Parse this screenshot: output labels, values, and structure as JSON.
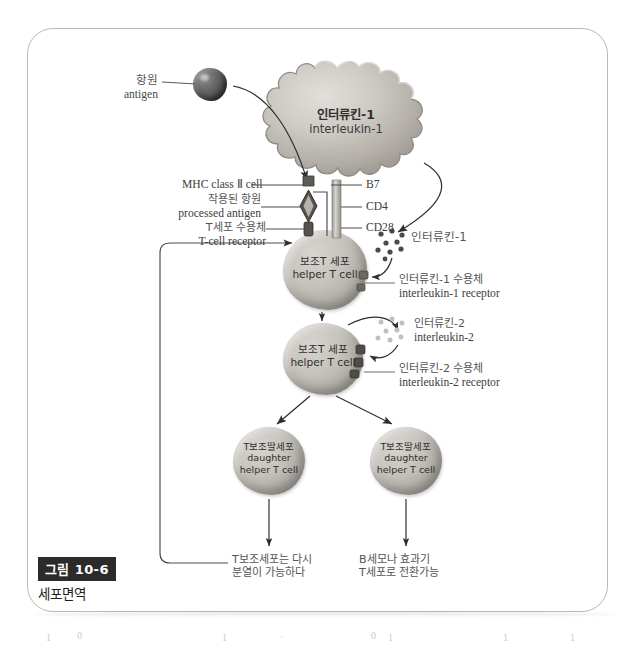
{
  "figure": {
    "number_badge": "그림 10-6",
    "title": "세포면역"
  },
  "cells": {
    "antigen": {
      "ko": "항원",
      "en": "antigen"
    },
    "macrophage": {
      "ko": "인터류킨-1",
      "en": "interleukin-1"
    },
    "helper_t_1": {
      "ko": "보조T 세포",
      "en": "helper T cell"
    },
    "helper_t_2": {
      "ko": "보조T 세포",
      "en": "helper T cell"
    },
    "daughter_left": {
      "ko": "T보조딸세포",
      "en1": "daughter",
      "en2": "helper T cell"
    },
    "daughter_right": {
      "ko": "T보조딸세포",
      "en1": "daughter",
      "en2": "helper T cell"
    }
  },
  "labels_left": {
    "mhc": "MHC class Ⅱ cell",
    "processed_antigen_ko": "작용된 항원",
    "processed_antigen_en": "processed antigen",
    "tcr_ko": "T세포 수용체",
    "tcr_en": "T-cell receptor"
  },
  "labels_right": {
    "b7": "B7",
    "cd4": "CD4",
    "cd28": "CD28",
    "il1_ko": "인터류킨-1",
    "il1_receptor_ko": "인터류킨-1 수용체",
    "il1_receptor_en": "interleukin-1 receptor",
    "il2_ko": "인터류킨-2",
    "il2_en": "interleukin-2",
    "il2_receptor_ko": "인터류킨-2 수용체",
    "il2_receptor_en": "interleukin-2 receptor"
  },
  "footnotes": {
    "left_line1": "T보조세포는 다시",
    "left_line2": "분열이 가능하다",
    "right_line1": "B세모나 효과기",
    "right_line2": "T세포로 전환가능"
  },
  "artifacts": [
    "1",
    "0",
    "1",
    "·",
    "0",
    "1",
    "1",
    "1"
  ],
  "colors": {
    "frame": "#b9b9b9",
    "ink": "#3c3c3c",
    "badge_bg": "#2b2b2b",
    "cell_fill": "#c6c2bc",
    "antigen": "#4b4b4b"
  }
}
